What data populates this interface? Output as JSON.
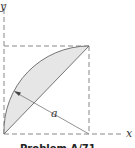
{
  "figure": {
    "axis_labels": {
      "x": "x",
      "y": "y"
    },
    "radius_label": "a",
    "caption": "Problem A/71",
    "colors": {
      "shade": "#e6e6e6",
      "line": "#666666",
      "dash": "#888888"
    }
  }
}
